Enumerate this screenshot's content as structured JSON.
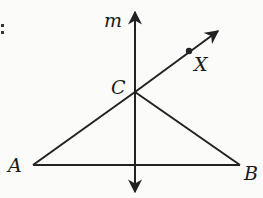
{
  "diagram": {
    "type": "geometry",
    "labels": {
      "line_m": "m",
      "point_c": "C",
      "point_x": "X",
      "point_a": "A",
      "point_b": "B",
      "edge_mark": ":"
    },
    "points": {
      "A": [
        33,
        165
      ],
      "B": [
        240,
        165
      ],
      "C": [
        135,
        92
      ],
      "X": [
        189,
        51
      ]
    },
    "line_m": {
      "x": 135,
      "y_top": 12,
      "y_bottom": 192
    },
    "ray_cx_end": [
      218,
      31
    ],
    "colors": {
      "ink": "#222222",
      "background": "#fbfbf9"
    }
  }
}
